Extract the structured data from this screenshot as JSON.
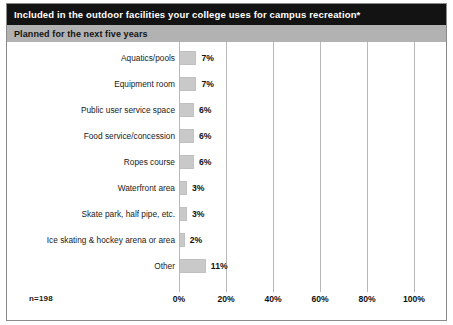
{
  "header": {
    "title": "Included in the outdoor facilities your college uses for campus recreation*",
    "subtitle": "Planned for the next five years"
  },
  "footer": {
    "sample_size": "n=198"
  },
  "colors": {
    "title_bar_bg": "#131313",
    "title_bar_text": "#ffffff",
    "subtitle_bar_bg": "#b2b2b2",
    "bar_fill": "#c9c9c9",
    "gridline": "#b9b9b9",
    "frame_border": "#8a8a8a"
  },
  "chart_data": {
    "type": "bar",
    "orientation": "horizontal",
    "title": "Included in the outdoor facilities your college uses for campus recreation*",
    "subtitle": "Planned for the next five years",
    "xlabel": "",
    "ylabel": "",
    "xlim": [
      0,
      100
    ],
    "grid": true,
    "legend": "none",
    "sample_size": "n=198",
    "x_tick_labels": [
      "0%",
      "20%",
      "40%",
      "60%",
      "80%",
      "100%"
    ],
    "x_tick_values": [
      0,
      20,
      40,
      60,
      80,
      100
    ],
    "categories": [
      "Aquatics/pools",
      "Equipment room",
      "Public user service space",
      "Food service/concession",
      "Ropes course",
      "Waterfront area",
      "Skate park, half pipe, etc.",
      "Ice skating & hockey arena or area",
      "Other"
    ],
    "values": [
      7,
      7,
      6,
      6,
      6,
      3,
      3,
      2,
      11
    ],
    "value_labels": [
      "7%",
      "7%",
      "6%",
      "6%",
      "6%",
      "3%",
      "3%",
      "2%",
      "11%"
    ]
  }
}
